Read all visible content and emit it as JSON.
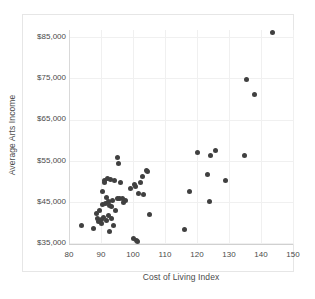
{
  "title_strip": "",
  "chart_data": {
    "type": "scatter",
    "title": "",
    "xlabel": "Cost of Living Index",
    "ylabel": "Average Arts Income",
    "xlim": [
      80,
      150
    ],
    "ylim": [
      35000,
      85000
    ],
    "xticks": [
      80,
      90,
      100,
      110,
      120,
      130,
      140,
      150
    ],
    "yticks": [
      35000,
      45000,
      55000,
      65000,
      75000,
      85000
    ],
    "ytick_labels": [
      "$35,000",
      "$45,000",
      "$55,000",
      "$65,000",
      "$75,000",
      "$85,000"
    ],
    "xtick_labels": [
      "80",
      "90",
      "100",
      "110",
      "120",
      "130",
      "140",
      "150"
    ],
    "grid": true,
    "legend": false,
    "marker_color": "#404040",
    "marker_size": 5,
    "series": [
      {
        "name": "Metro areas",
        "points": [
          [
            83.8,
            39200
          ],
          [
            87.5,
            38500
          ],
          [
            88.6,
            42100
          ],
          [
            89.0,
            41000
          ],
          [
            89.3,
            40200
          ],
          [
            89.6,
            43000
          ],
          [
            90.0,
            40600
          ],
          [
            90.3,
            39800
          ],
          [
            90.4,
            44300
          ],
          [
            90.6,
            47500
          ],
          [
            90.8,
            41200
          ],
          [
            91.0,
            50200
          ],
          [
            91.2,
            49600
          ],
          [
            91.4,
            44700
          ],
          [
            91.6,
            40400
          ],
          [
            91.8,
            46100
          ],
          [
            92.0,
            50600
          ],
          [
            92.2,
            45100
          ],
          [
            92.4,
            41600
          ],
          [
            92.6,
            44200
          ],
          [
            92.8,
            37700
          ],
          [
            93.0,
            50300
          ],
          [
            93.2,
            43900
          ],
          [
            93.4,
            40900
          ],
          [
            93.6,
            45400
          ],
          [
            93.8,
            39300
          ],
          [
            94.3,
            50100
          ],
          [
            94.6,
            42800
          ],
          [
            95.0,
            55700
          ],
          [
            95.2,
            45900
          ],
          [
            95.5,
            54400
          ],
          [
            95.8,
            45800
          ],
          [
            96.2,
            49800
          ],
          [
            96.6,
            45700
          ],
          [
            97.0,
            44900
          ],
          [
            97.6,
            45200
          ],
          [
            99.3,
            48200
          ],
          [
            100.2,
            36100
          ],
          [
            100.6,
            49200
          ],
          [
            100.9,
            48800
          ],
          [
            101.2,
            35500
          ],
          [
            101.5,
            35300
          ],
          [
            101.8,
            47000
          ],
          [
            102.4,
            49600
          ],
          [
            103.0,
            51200
          ],
          [
            103.4,
            46800
          ],
          [
            104.2,
            52600
          ],
          [
            104.6,
            52300
          ],
          [
            105.0,
            41800
          ],
          [
            116.0,
            38200
          ],
          [
            117.6,
            47400
          ],
          [
            120.3,
            57000
          ],
          [
            123.4,
            51600
          ],
          [
            123.8,
            45000
          ],
          [
            124.2,
            56300
          ],
          [
            125.9,
            57500
          ],
          [
            128.8,
            50100
          ],
          [
            134.9,
            56200
          ],
          [
            135.6,
            74800
          ],
          [
            137.9,
            71000
          ],
          [
            143.5,
            86100
          ]
        ]
      }
    ]
  }
}
